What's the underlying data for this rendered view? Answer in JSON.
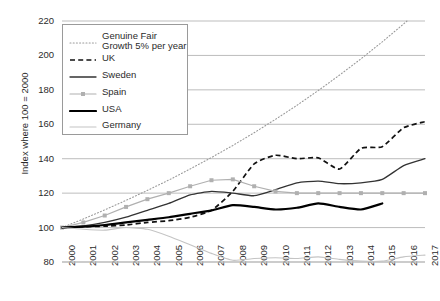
{
  "chart_data": {
    "type": "line",
    "title": "",
    "xlabel": "",
    "ylabel": "Index where 100 = 2000",
    "ylim": [
      80,
      220
    ],
    "yticks": [
      80,
      100,
      120,
      140,
      160,
      180,
      200,
      220
    ],
    "grid": true,
    "legend_position": "top-left",
    "x": [
      2000,
      2001,
      2002,
      2003,
      2004,
      2005,
      2006,
      2007,
      2008,
      2009,
      2010,
      2011,
      2012,
      2013,
      2014,
      2015,
      2016,
      2017
    ],
    "categories": [
      "2000",
      "2001",
      "2002",
      "2003",
      "2004",
      "2005",
      "2006",
      "2007",
      "2008",
      "2009",
      "2010",
      "2011",
      "2012",
      "2013",
      "2014",
      "2015",
      "2016",
      "2017"
    ],
    "series": [
      {
        "name": "Genuine Fair\nGrowth 5% per year",
        "style": "dotted",
        "color": "#9a9a9a",
        "values": [
          100,
          105,
          110.3,
          115.8,
          121.6,
          127.6,
          134,
          140.7,
          147.7,
          155.1,
          162.9,
          171,
          179.6,
          188.6,
          198,
          207.9,
          218.3,
          229.2
        ]
      },
      {
        "name": "UK",
        "style": "dashed",
        "color": "#111111",
        "values": [
          100,
          100.5,
          100.8,
          101.5,
          103,
          104,
          106,
          110,
          121,
          137,
          142,
          140,
          140.5,
          134,
          146,
          147,
          158,
          161.5
        ]
      },
      {
        "name": "Sweden",
        "style": "solid-thin",
        "color": "#333333",
        "values": [
          100,
          101,
          103,
          106,
          110,
          114,
          119,
          121,
          120,
          118.5,
          122,
          126,
          127,
          125.5,
          126,
          128,
          136,
          140
        ]
      },
      {
        "name": "Spain",
        "style": "marker-line",
        "color": "#b0b0b0",
        "values": [
          100,
          103,
          107,
          112,
          116.5,
          120,
          124,
          127.5,
          128,
          124,
          121,
          120,
          120,
          120,
          120,
          120,
          120,
          120
        ]
      },
      {
        "name": "USA",
        "style": "solid-thick",
        "color": "#000000",
        "values": [
          100,
          100.5,
          101.5,
          103,
          104.5,
          106,
          108,
          110,
          113,
          112,
          110.5,
          111.5,
          114,
          112,
          110.5,
          114,
          null,
          null
        ]
      },
      {
        "name": "Germany",
        "style": "solid-light",
        "color": "#c4c4c4",
        "values": [
          100,
          99,
          98.5,
          100,
          99,
          95,
          90,
          85,
          81,
          82,
          82.5,
          82,
          83,
          81.5,
          80.5,
          80.5,
          83,
          84
        ]
      }
    ]
  },
  "legend": {
    "entries": [
      {
        "label": "Genuine Fair\nGrowth 5% per year",
        "swatch": "dotted-swatch"
      },
      {
        "label": "UK",
        "swatch": "dashed-swatch"
      },
      {
        "label": "Sweden",
        "swatch": "thin-line-swatch"
      },
      {
        "label": "Spain",
        "swatch": "marker-line-swatch"
      },
      {
        "label": "USA",
        "swatch": "thick-line-swatch"
      },
      {
        "label": "Germany",
        "swatch": "light-line-swatch"
      }
    ]
  },
  "axes": {
    "y_title": "Index where 100 = 2000",
    "y_ticks": [
      "220",
      "200",
      "180",
      "160",
      "140",
      "120",
      "100",
      "80"
    ],
    "x_ticks": [
      "2000",
      "2001",
      "2002",
      "2003",
      "2004",
      "2005",
      "2006",
      "2007",
      "2008",
      "2009",
      "2010",
      "2011",
      "2012",
      "2013",
      "2014",
      "2015",
      "2016",
      "2017"
    ]
  },
  "colors": {
    "grid": "#b5b5b5",
    "text": "#2b2b2b",
    "uk": "#111111",
    "sweden": "#333333",
    "spain": "#b0b0b0",
    "usa": "#000000",
    "germany": "#c4c4c4",
    "fair_growth": "#9a9a9a"
  }
}
